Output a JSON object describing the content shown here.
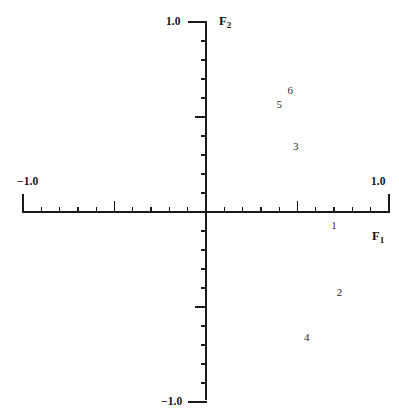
{
  "chart_data": {
    "type": "scatter",
    "title": "",
    "xlabel": "F1",
    "ylabel": "F2",
    "xlim": [
      -1.0,
      1.0
    ],
    "ylim": [
      -1.0,
      1.0
    ],
    "grid": false,
    "legend": null,
    "marker_style": "numeric-text-label",
    "points": [
      {
        "label": "1",
        "x": 0.7,
        "y": -0.07
      },
      {
        "label": "2",
        "x": 0.73,
        "y": -0.42
      },
      {
        "label": "3",
        "x": 0.49,
        "y": 0.35
      },
      {
        "label": "4",
        "x": 0.55,
        "y": -0.66
      },
      {
        "label": "5",
        "x": 0.4,
        "y": 0.57
      },
      {
        "label": "6",
        "x": 0.46,
        "y": 0.64
      }
    ],
    "x_tick_labels": [
      {
        "value": -1.0,
        "text": "−1.0"
      },
      {
        "value": 1.0,
        "text": "1.0"
      }
    ],
    "y_tick_labels": [
      {
        "value": 1.0,
        "text": "1.0"
      },
      {
        "value": -1.0,
        "text": "−1.0"
      }
    ],
    "minor_tick_step": 0.1,
    "major_tick_values": [
      -0.5,
      0.5
    ]
  },
  "axes": {
    "x_title": "F",
    "x_subscript": "1",
    "y_title": "F",
    "y_subscript": "2"
  },
  "labels": {
    "x_min": "−1.0",
    "x_max": "1.0",
    "y_max": "1.0",
    "y_min": "−1.0"
  },
  "colors": {
    "axis": "#1a1a1a",
    "text": "#141414",
    "point_text": "#2a2a2a",
    "background": "#ffffff"
  }
}
